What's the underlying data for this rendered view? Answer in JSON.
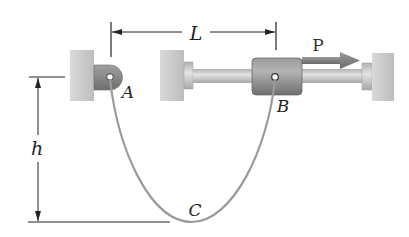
{
  "diagram": {
    "type": "mechanics-figure",
    "labels": {
      "L": "L",
      "P": "P",
      "A": "A",
      "B": "B",
      "C": "C",
      "h": "h"
    },
    "colors": {
      "wall": "#cfcfcf",
      "wall_shade": "#b9b9b9",
      "bracket": "#8a8a8a",
      "collar": "#8c8c8c",
      "rod": "#c8c8c8",
      "cable": "#9a9a9a",
      "force_arrow": "#7a7a7a",
      "dimension": "#222222"
    },
    "elements": {
      "left_support": "Fixed wall with pinned bracket at A",
      "rod_assembly": "Horizontal rod between two walls with sliding collar at B",
      "cable": "Cable hanging from A to B, sagging to lowest point C",
      "force": "Horizontal force P applied to collar B",
      "dim_L": "Horizontal distance L between A and B",
      "dim_h": "Vertical sag h from AB to C"
    }
  }
}
